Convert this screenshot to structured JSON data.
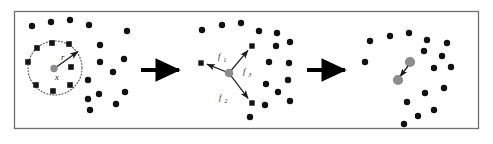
{
  "figure": {
    "width": 493,
    "height": 144,
    "background_color": "#ffffff",
    "frame": {
      "x": 14,
      "y": 11,
      "width": 464,
      "height": 117,
      "stroke_color": "#6e6e6e",
      "stroke_width": 1.2,
      "fill": "#ffffff"
    }
  },
  "colors": {
    "point_black": "#111111",
    "square_black": "#151515",
    "focal_gray": "#8c8c8c",
    "arrow_black": "#000000",
    "thin_line": "#222222",
    "dotted_circle": "#4d4d4d",
    "frame_gray": "#6e6e6e"
  },
  "panels": [
    {
      "id": "panel-1",
      "name": "neighborhood-selection",
      "labels": [
        {
          "id": "radius-label",
          "text": "r",
          "x": 61,
          "y": 59
        },
        {
          "id": "position-label",
          "text": "x",
          "x": 58,
          "y": 79
        }
      ],
      "focal_point": {
        "x": 54,
        "y": 69,
        "r": 3.6,
        "color": "#8c8c8c"
      },
      "neighborhood_circle": {
        "cx": 55,
        "cy": 68,
        "r": 27
      },
      "radius_arrow": {
        "x1": 55,
        "y1": 68,
        "x2": 79,
        "y2": 51
      },
      "squares": [
        {
          "x": 37,
          "y": 48
        },
        {
          "x": 52,
          "y": 43
        },
        {
          "x": 69,
          "y": 44
        },
        {
          "x": 28,
          "y": 62
        },
        {
          "x": 71,
          "y": 67
        },
        {
          "x": 36,
          "y": 85
        },
        {
          "x": 53,
          "y": 91
        },
        {
          "x": 70,
          "y": 85
        }
      ],
      "points": [
        {
          "x": 32,
          "y": 26
        },
        {
          "x": 51,
          "y": 22
        },
        {
          "x": 70,
          "y": 20
        },
        {
          "x": 89,
          "y": 25
        },
        {
          "x": 127,
          "y": 31
        },
        {
          "x": 100,
          "y": 45
        },
        {
          "x": 124,
          "y": 59
        },
        {
          "x": 100,
          "y": 62
        },
        {
          "x": 88,
          "y": 80
        },
        {
          "x": 113,
          "y": 72
        },
        {
          "x": 99,
          "y": 94
        },
        {
          "x": 125,
          "y": 92
        },
        {
          "x": 116,
          "y": 104
        },
        {
          "x": 90,
          "y": 110
        },
        {
          "x": 88,
          "y": 99
        }
      ]
    },
    {
      "id": "panel-2",
      "name": "force-vectors",
      "labels": [
        {
          "id": "force-1-label",
          "text": "f",
          "sub": "1",
          "x": 221,
          "y": 58
        },
        {
          "id": "force-2-label",
          "text": "f",
          "sub": "2",
          "x": 222,
          "y": 99
        },
        {
          "id": "force-3-label",
          "text": "f",
          "sub": "3",
          "x": 246,
          "y": 73
        }
      ],
      "focal_point": {
        "x": 229,
        "y": 73,
        "r": 4.2,
        "color": "#8c8c8c"
      },
      "force_arrows": [
        {
          "id": "f1",
          "x1": 229,
          "y1": 73,
          "x2": 204,
          "y2": 63
        },
        {
          "id": "f2",
          "x1": 229,
          "y1": 73,
          "x2": 250,
          "y2": 101
        },
        {
          "id": "f3",
          "x1": 229,
          "y1": 73,
          "x2": 250,
          "y2": 48
        }
      ],
      "squares": [
        {
          "x": 201,
          "y": 63
        },
        {
          "x": 252,
          "y": 46
        },
        {
          "x": 252,
          "y": 103
        }
      ],
      "points": [
        {
          "x": 202,
          "y": 30
        },
        {
          "x": 222,
          "y": 25
        },
        {
          "x": 241,
          "y": 23
        },
        {
          "x": 259,
          "y": 31
        },
        {
          "x": 277,
          "y": 33
        },
        {
          "x": 276,
          "y": 46
        },
        {
          "x": 290,
          "y": 42
        },
        {
          "x": 269,
          "y": 62
        },
        {
          "x": 289,
          "y": 63
        },
        {
          "x": 266,
          "y": 84
        },
        {
          "x": 288,
          "y": 80
        },
        {
          "x": 278,
          "y": 92
        },
        {
          "x": 290,
          "y": 101
        },
        {
          "x": 265,
          "y": 105
        },
        {
          "x": 250,
          "y": 117
        }
      ]
    },
    {
      "id": "panel-3",
      "name": "resulting-movement",
      "labels": [],
      "moved_points": [
        {
          "id": "origin-position",
          "x": 410,
          "y": 62,
          "r": 5.0,
          "color": "#8c8c8c"
        },
        {
          "id": "new-position",
          "x": 398,
          "y": 80,
          "r": 5.0,
          "color": "#8c8c8c"
        }
      ],
      "move_arrow": {
        "x1": 408,
        "y1": 66,
        "x2": 399,
        "y2": 78
      },
      "points": [
        {
          "x": 370,
          "y": 41
        },
        {
          "x": 390,
          "y": 36
        },
        {
          "x": 409,
          "y": 33
        },
        {
          "x": 427,
          "y": 40
        },
        {
          "x": 447,
          "y": 43
        },
        {
          "x": 365,
          "y": 62
        },
        {
          "x": 424,
          "y": 51
        },
        {
          "x": 442,
          "y": 56
        },
        {
          "x": 434,
          "y": 68
        },
        {
          "x": 451,
          "y": 67
        },
        {
          "x": 444,
          "y": 88
        },
        {
          "x": 425,
          "y": 93
        },
        {
          "x": 407,
          "y": 102
        },
        {
          "x": 434,
          "y": 110
        },
        {
          "x": 418,
          "y": 116
        },
        {
          "x": 404,
          "y": 124
        }
      ]
    }
  ],
  "transitions": [
    {
      "id": "transition-arrow-1",
      "x1": 141,
      "y1": 70,
      "x2": 183,
      "y2": 70
    },
    {
      "id": "transition-arrow-2",
      "x1": 307,
      "y1": 70,
      "x2": 349,
      "y2": 70
    }
  ]
}
